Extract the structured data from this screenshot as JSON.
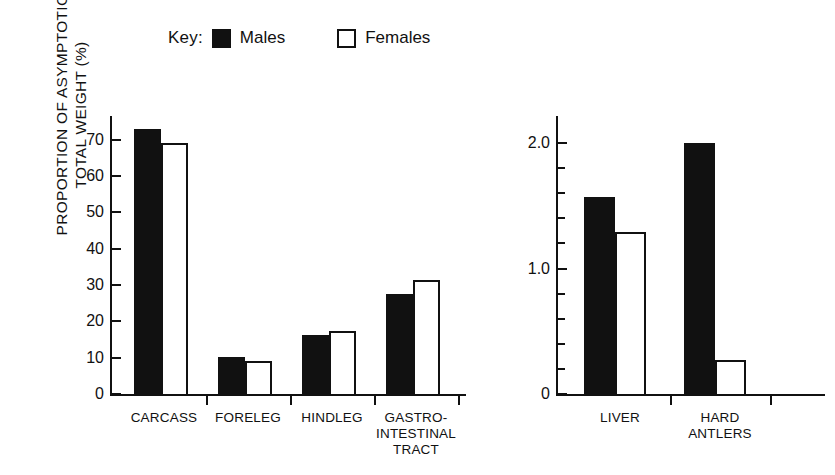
{
  "legend": {
    "key_text": "Key:",
    "male_label": "Males",
    "female_label": "Females",
    "male_swatch": "filled-square-icon",
    "female_swatch": "open-square-icon",
    "male_color": "#111111",
    "female_color": "#ffffff"
  },
  "axis": {
    "ylabel_line1": "PROPORTION OF ASYMPTOTIC",
    "ylabel_line2": "TOTAL WEIGHT (%)"
  },
  "left_panel": {
    "ticks": [
      "0",
      "10",
      "20",
      "30",
      "40",
      "50",
      "60",
      "70"
    ],
    "categories": [
      {
        "lines": [
          "CARCASS"
        ]
      },
      {
        "lines": [
          "FORELEG"
        ]
      },
      {
        "lines": [
          "HINDLEG"
        ]
      },
      {
        "lines": [
          "GASTRO-",
          "INTESTINAL",
          "TRACT"
        ]
      }
    ]
  },
  "right_panel": {
    "ticks": [
      "0",
      "1.0",
      "2.0"
    ],
    "categories": [
      {
        "lines": [
          "LIVER"
        ]
      },
      {
        "lines": [
          "HARD",
          "ANTLERS"
        ]
      }
    ]
  },
  "chart_data": [
    {
      "type": "bar",
      "title": "",
      "panel": "left",
      "xlabel": "",
      "ylabel": "PROPORTION OF ASYMPTOTIC TOTAL WEIGHT (%)",
      "ylim": [
        0,
        76
      ],
      "yticks": [
        0,
        10,
        20,
        30,
        40,
        50,
        60,
        70
      ],
      "grid": false,
      "legend_position": "top",
      "categories": [
        "CARCASS",
        "FORELEG",
        "HINDLEG",
        "GASTRO-INTESTINAL TRACT"
      ],
      "series": [
        {
          "name": "Males",
          "values": [
            73,
            10.2,
            16.2,
            27.4
          ]
        },
        {
          "name": "Females",
          "values": [
            69,
            9.2,
            17.4,
            31.4
          ]
        }
      ]
    },
    {
      "type": "bar",
      "title": "",
      "panel": "right",
      "xlabel": "",
      "ylabel": "PROPORTION OF ASYMPTOTIC TOTAL WEIGHT (%)",
      "ylim": [
        0,
        2.2
      ],
      "yticks": [
        0,
        0.2,
        0.4,
        0.6,
        0.8,
        1.0,
        1.2,
        1.4,
        1.6,
        1.8,
        2.0
      ],
      "ytick_labels": [
        "0",
        "1.0",
        "2.0"
      ],
      "grid": false,
      "legend_position": "top",
      "categories": [
        "LIVER",
        "HARD ANTLERS"
      ],
      "series": [
        {
          "name": "Males",
          "values": [
            1.57,
            2.0
          ]
        },
        {
          "name": "Females",
          "values": [
            1.29,
            0.27
          ]
        }
      ]
    }
  ]
}
